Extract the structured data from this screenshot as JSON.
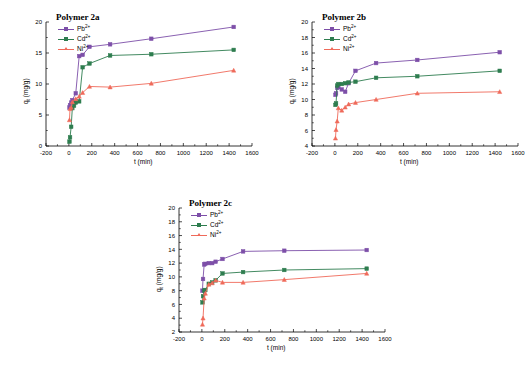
{
  "figure": {
    "background": "#ffffff",
    "series_colors": {
      "Pb": "#7d4fa8",
      "Cd": "#2e7d4f",
      "Ni": "#ef6a5a"
    }
  },
  "legend": {
    "pb_label": "Pb",
    "cd_label": "Cd",
    "ni_label": "Ni",
    "charge": "2+"
  },
  "axis": {
    "xlabel_main": "t",
    "xlabel_unit": "(min)",
    "ylabel_main": "q",
    "ylabel_sub": "t",
    "ylabel_unit": "(mg/g)"
  },
  "chart_data": [
    {
      "id": "polymer-2a",
      "type": "line",
      "title": "Polymer 2a",
      "xlabel": "t (min)",
      "ylabel": "qt (mg/g)",
      "xlim": [
        -200,
        1600
      ],
      "ylim": [
        0,
        20
      ],
      "xticks": [
        -200,
        0,
        200,
        400,
        600,
        800,
        1000,
        1200,
        1400,
        1600
      ],
      "yticks": [
        0,
        5,
        10,
        15,
        20
      ],
      "grid": false,
      "legend_position": "top-left",
      "series": [
        {
          "name": "Pb2+",
          "color": "#7d4fa8",
          "marker": "square",
          "x": [
            5,
            10,
            20,
            30,
            60,
            90,
            120,
            180,
            360,
            720,
            1440
          ],
          "y": [
            6.2,
            6.6,
            7.0,
            7.4,
            8.5,
            14.5,
            14.7,
            16.0,
            16.4,
            17.3,
            19.2
          ]
        },
        {
          "name": "Cd2+",
          "color": "#2e7d4f",
          "marker": "square",
          "x": [
            5,
            10,
            20,
            30,
            45,
            60,
            90,
            120,
            180,
            360,
            720,
            1440
          ],
          "y": [
            0.7,
            1.4,
            3.1,
            6.1,
            6.5,
            7.0,
            7.2,
            12.7,
            13.3,
            14.6,
            14.8,
            15.5
          ]
        },
        {
          "name": "Ni2+",
          "color": "#ef6a5a",
          "marker": "triangle",
          "x": [
            5,
            10,
            20,
            30,
            60,
            90,
            120,
            180,
            360,
            720,
            1440
          ],
          "y": [
            4.2,
            6.0,
            6.2,
            7.1,
            7.6,
            8.0,
            8.6,
            9.6,
            9.5,
            10.1,
            12.2
          ]
        }
      ]
    },
    {
      "id": "polymer-2b",
      "type": "line",
      "title": "Polymer 2b",
      "xlabel": "t (min)",
      "ylabel": "qt (mg/g)",
      "xlim": [
        -200,
        1600
      ],
      "ylim": [
        4,
        20
      ],
      "xticks": [
        -200,
        0,
        200,
        400,
        600,
        800,
        1000,
        1200,
        1400,
        1600
      ],
      "yticks": [
        4,
        6,
        8,
        10,
        12,
        14,
        16,
        18,
        20
      ],
      "grid": false,
      "legend_position": "top-left",
      "series": [
        {
          "name": "Pb2+",
          "color": "#7d4fa8",
          "marker": "square",
          "x": [
            5,
            10,
            20,
            30,
            60,
            90,
            120,
            180,
            360,
            720,
            1440
          ],
          "y": [
            10.6,
            10.8,
            11.5,
            11.6,
            11.3,
            11.0,
            12.1,
            13.7,
            14.7,
            15.1,
            16.1
          ]
        },
        {
          "name": "Cd2+",
          "color": "#2e7d4f",
          "marker": "square",
          "x": [
            5,
            10,
            20,
            30,
            60,
            90,
            120,
            180,
            360,
            720,
            1440
          ],
          "y": [
            9.3,
            9.5,
            11.8,
            12.0,
            12.0,
            12.1,
            12.2,
            12.3,
            12.8,
            13.0,
            13.7
          ]
        },
        {
          "name": "Ni2+",
          "color": "#ef6a5a",
          "marker": "triangle",
          "x": [
            5,
            10,
            20,
            30,
            60,
            90,
            120,
            180,
            360,
            720,
            1440
          ],
          "y": [
            5.0,
            6.1,
            7.2,
            8.9,
            8.6,
            9.0,
            9.4,
            9.6,
            10.0,
            10.8,
            11.0
          ]
        }
      ]
    },
    {
      "id": "polymer-2c",
      "type": "line",
      "title": "Polymer 2c",
      "xlabel": "t (min)",
      "ylabel": "qt (mg/g)",
      "xlim": [
        -200,
        1600
      ],
      "ylim": [
        2,
        20
      ],
      "xticks": [
        -200,
        0,
        200,
        400,
        600,
        800,
        1000,
        1200,
        1400,
        1600
      ],
      "yticks": [
        2,
        4,
        6,
        8,
        10,
        12,
        14,
        16,
        18,
        20
      ],
      "grid": false,
      "legend_position": "top-left",
      "series": [
        {
          "name": "Pb2+",
          "color": "#7d4fa8",
          "marker": "square",
          "x": [
            5,
            10,
            20,
            30,
            60,
            90,
            120,
            180,
            360,
            720,
            1440
          ],
          "y": [
            8.0,
            9.7,
            11.8,
            11.9,
            12.0,
            12.0,
            12.2,
            12.6,
            13.7,
            13.8,
            13.9
          ]
        },
        {
          "name": "Cd2+",
          "color": "#2e7d4f",
          "marker": "square",
          "x": [
            5,
            10,
            20,
            30,
            60,
            90,
            120,
            180,
            360,
            720,
            1440
          ],
          "y": [
            6.3,
            7.2,
            8.0,
            8.1,
            9.0,
            9.2,
            9.5,
            10.5,
            10.7,
            11.0,
            11.2
          ]
        },
        {
          "name": "Ni2+",
          "color": "#ef6a5a",
          "marker": "triangle",
          "x": [
            5,
            10,
            20,
            30,
            60,
            90,
            120,
            180,
            360,
            720,
            1440
          ],
          "y": [
            3.1,
            4.0,
            6.9,
            7.6,
            8.9,
            9.1,
            9.5,
            9.2,
            9.2,
            9.6,
            10.5
          ]
        }
      ]
    }
  ]
}
